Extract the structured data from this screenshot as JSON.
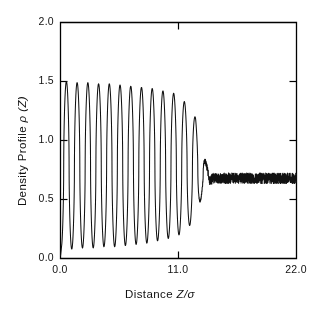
{
  "figure": {
    "axis_color": "#000000",
    "curve_color": "#111111",
    "background": "#ffffff"
  },
  "axes": {
    "ylabel_prefix": "Density Profile ",
    "ylabel_symbol": "ρ (Z)",
    "xlabel_prefix": "Distance ",
    "xlabel_symbol": "Z/σ",
    "y_ticks": [
      "0.0",
      "0.5",
      "1.0",
      "1.5",
      "2.0"
    ],
    "x_ticks": [
      "0.0",
      "11.0",
      "22.0"
    ]
  },
  "chart_data": {
    "type": "line",
    "title": "",
    "xlabel": "Distance Z/σ",
    "ylabel": "Density Profile ρ (Z)",
    "xlim": [
      0.0,
      22.0
    ],
    "ylim": [
      0.0,
      2.0
    ],
    "xticks": [
      0.0,
      11.0,
      22.0
    ],
    "yticks": [
      0.0,
      0.5,
      1.0,
      1.5,
      2.0
    ],
    "grid": false,
    "legend": null,
    "series": [
      {
        "name": "density profile",
        "period": 1.0,
        "bulk_density": 0.68,
        "noise_onset_x": 13.8,
        "noise_amplitude": 0.045,
        "peaks": [
          {
            "x": 0.55,
            "y": 1.5
          },
          {
            "x": 1.55,
            "y": 1.49
          },
          {
            "x": 2.55,
            "y": 1.49
          },
          {
            "x": 3.55,
            "y": 1.48
          },
          {
            "x": 4.55,
            "y": 1.48
          },
          {
            "x": 5.55,
            "y": 1.47
          },
          {
            "x": 6.55,
            "y": 1.46
          },
          {
            "x": 7.55,
            "y": 1.45
          },
          {
            "x": 8.55,
            "y": 1.44
          },
          {
            "x": 9.55,
            "y": 1.42
          },
          {
            "x": 10.55,
            "y": 1.4
          },
          {
            "x": 11.55,
            "y": 1.33
          },
          {
            "x": 12.55,
            "y": 1.2
          },
          {
            "x": 13.55,
            "y": 1.0
          },
          {
            "x": 14.55,
            "y": 0.82
          },
          {
            "x": 15.55,
            "y": 0.72
          }
        ],
        "troughs": [
          {
            "x": 1.05,
            "y": 0.08
          },
          {
            "x": 2.05,
            "y": 0.09
          },
          {
            "x": 3.05,
            "y": 0.09
          },
          {
            "x": 4.05,
            "y": 0.1
          },
          {
            "x": 5.05,
            "y": 0.1
          },
          {
            "x": 6.05,
            "y": 0.11
          },
          {
            "x": 7.05,
            "y": 0.12
          },
          {
            "x": 8.05,
            "y": 0.13
          },
          {
            "x": 9.05,
            "y": 0.15
          },
          {
            "x": 10.05,
            "y": 0.17
          },
          {
            "x": 11.05,
            "y": 0.2
          },
          {
            "x": 12.05,
            "y": 0.28
          },
          {
            "x": 13.05,
            "y": 0.42
          },
          {
            "x": 14.05,
            "y": 0.56
          },
          {
            "x": 15.05,
            "y": 0.64
          }
        ]
      }
    ]
  }
}
